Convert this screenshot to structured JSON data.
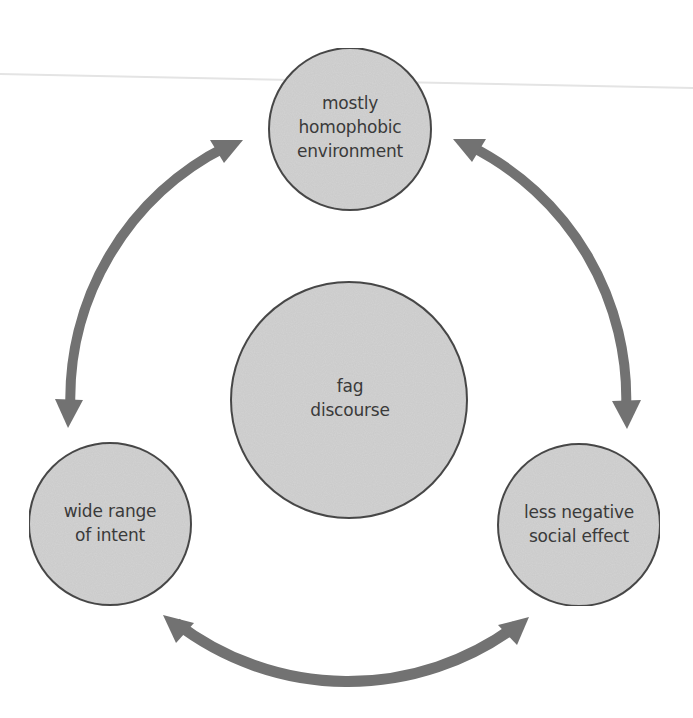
{
  "diagram": {
    "type": "cycle",
    "colors": {
      "background": "#ffffff",
      "node_fill": "#d3d3d3",
      "node_stroke": "#4a4a4a",
      "arrow": "#727272",
      "text": "#3a3a3a",
      "scan_line": "#e6e6e6"
    },
    "center_node": {
      "lines": [
        "fag",
        "discourse"
      ]
    },
    "nodes": [
      {
        "id": "top",
        "lines": [
          "mostly",
          "homophobic",
          "environment"
        ]
      },
      {
        "id": "left",
        "lines": [
          "wide range",
          "of intent"
        ]
      },
      {
        "id": "right",
        "lines": [
          "less negative",
          "social effect"
        ]
      }
    ],
    "arrows": [
      {
        "between": [
          "top",
          "left"
        ],
        "bidirectional": true
      },
      {
        "between": [
          "top",
          "right"
        ],
        "bidirectional": true
      },
      {
        "between": [
          "left",
          "right"
        ],
        "bidirectional": true
      }
    ]
  }
}
